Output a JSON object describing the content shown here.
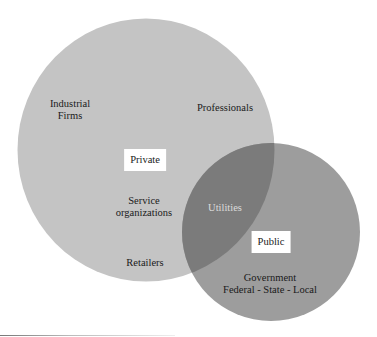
{
  "diagram": {
    "type": "venn",
    "colors": {
      "private_circle": "#c4c4c4",
      "public_circle": "#9d9d9d",
      "overlap": "#7b7b7b",
      "box_bg": "#ffffff",
      "overlap_text": "#dcdcdc"
    },
    "circles": [
      {
        "id": "private",
        "label": "Private",
        "members": [
          {
            "lines": [
              "Industrial",
              "Firms"
            ]
          },
          {
            "lines": [
              "Professionals"
            ]
          },
          {
            "lines": [
              "Service",
              "organizations"
            ]
          },
          {
            "lines": [
              "Retailers"
            ]
          }
        ]
      },
      {
        "id": "public",
        "label": "Public",
        "members": [
          {
            "lines": [
              "Government",
              "Federal - State - Local"
            ]
          }
        ]
      }
    ],
    "overlap": {
      "label": "Utilities"
    }
  }
}
